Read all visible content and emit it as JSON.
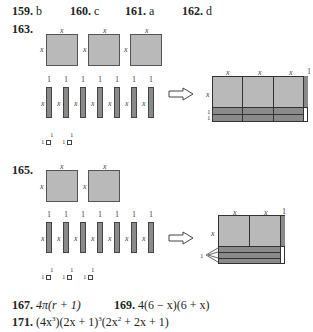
{
  "answers_row1": [
    {
      "num": "159.",
      "ans": "b"
    },
    {
      "num": "160.",
      "ans": "c"
    },
    {
      "num": "161.",
      "ans": "a"
    },
    {
      "num": "162.",
      "ans": "d"
    }
  ],
  "problem163": {
    "num": "163.",
    "square_label": "x",
    "bar_top_label": "1",
    "bar_side_label": "x",
    "unit_label": "1",
    "squares": 3,
    "bars": 7,
    "units": 2,
    "result": {
      "top_labels": [
        "x",
        "x",
        "x",
        "1"
      ],
      "side_labels": [
        "x",
        "1",
        "1"
      ]
    }
  },
  "problem165": {
    "num": "165.",
    "square_label": "x",
    "bar_top_label": "1",
    "bar_side_label": "x",
    "unit_label": "1",
    "squares": 2,
    "bars": 7,
    "units": 3,
    "result": {
      "top_labels": [
        "x",
        "x",
        "1"
      ],
      "side_labels": [
        "x",
        "1"
      ]
    }
  },
  "answers_bottom": [
    {
      "num": "167.",
      "ans": "4π(r + 1)"
    },
    {
      "num": "169.",
      "ans": "4(6 − x)(6 + x)"
    },
    {
      "num": "171.",
      "ans_parts": [
        "(4x",
        "3",
        ")(2x + 1)",
        "3",
        "(2x",
        "2",
        " + 2x + 1)"
      ]
    }
  ],
  "arrow_icon": "right-arrow-outline"
}
